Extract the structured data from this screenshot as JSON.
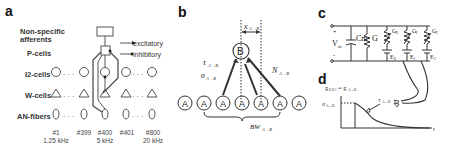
{
  "panels": {
    "a": {
      "label": "a",
      "rows": {
        "nonspecific": "Non-specific",
        "afferents": "afferents",
        "pcells": "P-cells",
        "i2cells": "I2-cells",
        "wcells": "W-cells",
        "anfibers": "AN-fibers"
      },
      "legend": {
        "excitatory": "excitatory",
        "inhibitory": "inhibitory"
      },
      "channels": [
        {
          "index": "#1",
          "freq": "1.25 kHz"
        },
        {
          "index": "#399",
          "freq": ""
        },
        {
          "index": "#400",
          "freq": "5 kHz"
        },
        {
          "index": "#401",
          "freq": ""
        },
        {
          "index": "#800",
          "freq": "20 kHz"
        }
      ],
      "ellipsis": "..."
    },
    "b": {
      "label": "b",
      "target_node": "B",
      "source_node": "A",
      "tau_label": "τ",
      "tau_sub": "A→B",
      "sigma_label": "σ",
      "sigma_sub": "A→B",
      "n_label": "N",
      "n_sub": "A→B",
      "bw_label": "BW",
      "bw_sub": "A→B",
      "delta_label": "x",
      "delta_sub": "A→B"
    },
    "c": {
      "label": "c",
      "vm": "V",
      "vm_sub": "m",
      "plus": "+",
      "minus": "-",
      "cm": "Cm",
      "g": "G",
      "ge": "G",
      "ge_sub": "E",
      "gi": "G",
      "gi_sub": "I",
      "gc": "G",
      "gc_sub": "C",
      "e1": "E",
      "e1_sub": "E",
      "e2": "E",
      "e2_sub": "I",
      "e3": "E",
      "e3_sub": "C"
    },
    "d": {
      "label": "d",
      "gformula": "g",
      "gformula_sub": "E/I/C",
      "gformula_rhs": "= g",
      "gformula_rhs_sub": "A→B",
      "sigma": "σ",
      "sigma_sub": "A→B",
      "tau": "τ",
      "tau_sub": "A→B",
      "t_axis": "t"
    }
  }
}
